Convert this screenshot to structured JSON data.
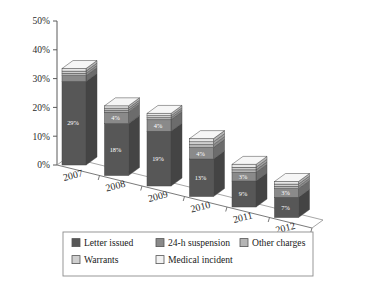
{
  "chart_data": {
    "type": "bar",
    "title": "",
    "subtitle": "",
    "xlabel": "",
    "ylabel": "",
    "stacked": true,
    "three_d": true,
    "grid": false,
    "legend_position": "bottom",
    "ylim": [
      0,
      50
    ],
    "ytick_labels": [
      "0%",
      "10%",
      "20%",
      "30%",
      "40%",
      "50%"
    ],
    "ytick_values": [
      0,
      10,
      20,
      30,
      40,
      50
    ],
    "categories": [
      "2007",
      "2008",
      "2009",
      "2010",
      "2011",
      "2012"
    ],
    "series": [
      {
        "name": "Letter issued",
        "color": "#575757",
        "values": [
          29,
          18,
          19,
          13,
          9,
          7
        ],
        "labels": [
          "29%",
          "18%",
          "19%",
          "13%",
          "9%",
          "7%"
        ]
      },
      {
        "name": "24-h suspension",
        "color": "#8a8a8a",
        "values": [
          2,
          4,
          4,
          4,
          3,
          3
        ],
        "labels": [
          "2%",
          "4%",
          "4%",
          "4%",
          "3%",
          "3%"
        ]
      },
      {
        "name": "Other charges",
        "color": "#b5b5b5",
        "values": [
          0.8,
          0.7,
          0.7,
          1.0,
          0.9,
          0.8
        ],
        "labels": [
          "",
          "",
          "",
          "",
          "",
          ""
        ]
      },
      {
        "name": "Warrants",
        "color": "#cfcfcf",
        "values": [
          0.8,
          0.7,
          0.7,
          1.0,
          0.9,
          0.8
        ],
        "labels": [
          "",
          "",
          "",
          "",
          "",
          ""
        ]
      },
      {
        "name": "Medical incident",
        "color": "#e8e8e8",
        "values": [
          0.9,
          0.8,
          0.8,
          1.1,
          1.0,
          0.9
        ],
        "labels": [
          "",
          "",
          "",
          "",
          "",
          ""
        ]
      }
    ],
    "totals": [
      33.5,
      24.2,
      25.2,
      20.1,
      14.8,
      12.5
    ]
  },
  "legend": {
    "items": [
      {
        "label": "Letter issued",
        "color": "#575757"
      },
      {
        "label": "24-h suspension",
        "color": "#8a8a8a"
      },
      {
        "label": "Other charges",
        "color": "#b5b5b5"
      },
      {
        "label": "Warrants",
        "color": "#cfcfcf"
      },
      {
        "label": "Medical incident",
        "color": "#f2f2f2"
      }
    ]
  },
  "axes": {
    "y_ticks": [
      "50%",
      "40%",
      "30%",
      "20%",
      "10%",
      "0%"
    ],
    "x_ticks": [
      "2007",
      "2008",
      "2009",
      "2010",
      "2011",
      "2012"
    ]
  },
  "bar_value_labels": {
    "b2007": [
      "2%",
      "29%"
    ],
    "b2008": [
      "4%",
      "18%"
    ],
    "b2009": [
      "4%",
      "19%"
    ],
    "b2010": [
      "4%",
      "13%"
    ],
    "b2011": [
      "3%",
      "9%"
    ],
    "b2012": [
      "3%",
      "7%"
    ]
  }
}
